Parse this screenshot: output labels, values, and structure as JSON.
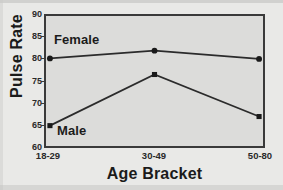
{
  "chart_data": {
    "type": "line",
    "title": "",
    "xlabel": "Age Bracket",
    "ylabel": "Pulse Rate",
    "categories": [
      "18-29",
      "30-49",
      "50-80"
    ],
    "ylim": [
      60,
      90
    ],
    "yticks": [
      60,
      65,
      70,
      75,
      80,
      85,
      90
    ],
    "grid": false,
    "legend_position": "inline-annotation",
    "series": [
      {
        "name": "Female",
        "marker": "circle",
        "values": [
          80.2,
          82.0,
          80.1
        ]
      },
      {
        "name": "Male",
        "marker": "square",
        "values": [
          64.7,
          76.5,
          66.8
        ]
      }
    ],
    "annotations": [
      {
        "text": "Female",
        "series": "Female"
      },
      {
        "text": "Male",
        "series": "Male"
      }
    ],
    "colors": {
      "line": "#2b2b2b",
      "marker": "#1a1a1a",
      "plot_background": "#dcdcda",
      "figure_background": "#e9e9e7",
      "axis": "#3a3a3a",
      "text": "#1b1b1b"
    }
  }
}
